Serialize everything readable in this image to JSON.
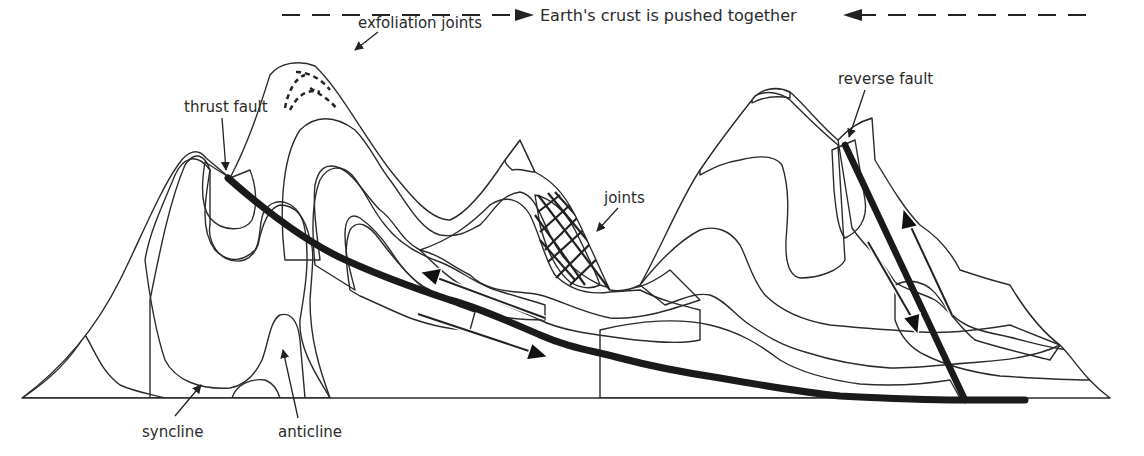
{
  "diagram": {
    "title": "Earth's crust is pushed together",
    "labels": {
      "exfoliation_joints": "exfoliation joints",
      "thrust_fault": "thrust fault",
      "joints": "joints",
      "reverse_fault": "reverse fault",
      "syncline": "syncline",
      "anticline": "anticline"
    },
    "colors": {
      "light": "#d4d4d4",
      "medium": "#a9a9a9",
      "dark": "#8b8b8b",
      "fault": "#1a1a1a",
      "outline": "#2b2b2b"
    }
  }
}
